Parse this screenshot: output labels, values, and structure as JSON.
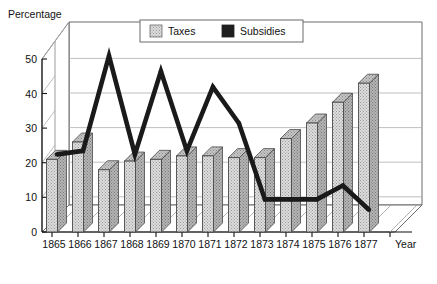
{
  "chart_data": {
    "type": "bar",
    "title": "",
    "subtitle": "",
    "xlabel": "Year",
    "ylabel": "Percentage",
    "categories": [
      "1865",
      "1866",
      "1867",
      "1868",
      "1869",
      "1870",
      "1871",
      "1872",
      "1873",
      "1874",
      "1875",
      "1876",
      "1877"
    ],
    "ylim": [
      0,
      55
    ],
    "yticks": [
      0,
      10,
      20,
      30,
      40,
      50
    ],
    "ytick_labels": [
      "0",
      "10",
      "20",
      "30",
      "40",
      "50"
    ],
    "grid": true,
    "grid_orientation": "horizontal-3d-backwall",
    "legend_position": "top-right-inside",
    "projection": "3d-perspective",
    "series": [
      {
        "name": "Taxes",
        "type": "bar",
        "color": "#d8d8d8",
        "pattern": "stipple-dots",
        "values": [
          21,
          26,
          18,
          20.5,
          21,
          22,
          22,
          21.5,
          21.5,
          27,
          31.5,
          37.5,
          43
        ]
      },
      {
        "name": "Subsidies",
        "type": "line",
        "color": "#1a1a1a",
        "pattern": "solid-thick",
        "values": [
          21,
          22,
          49.5,
          21,
          45,
          22,
          40.5,
          30,
          8,
          8,
          8,
          12,
          5
        ]
      }
    ],
    "annotations": []
  },
  "axes": {
    "y_axis_title": "Percentage",
    "x_axis_title": "Year"
  },
  "legend": {
    "items": [
      {
        "label": "Taxes",
        "swatch": "light-stipple-swatch"
      },
      {
        "label": "Subsidies",
        "swatch": "dark-solid-swatch"
      }
    ]
  }
}
